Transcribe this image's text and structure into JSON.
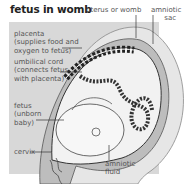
{
  "title": "fetus in womb",
  "labels": {
    "uterus": "uterus or womb",
    "amniotic_sac": "amniotic\n      sac",
    "placenta": "placenta\n(supplies food and\noxygen to fetus)",
    "umbilical_cord": "umbilical cord\n(connects fetus\nwith placenta)",
    "fetus": "fetus\n(unborn\nbaby)",
    "cervix": "cervix",
    "amniotic_fluid": "amniotic\nfluid"
  },
  "colors": {
    "panel": "#d8d8d8",
    "outline": "#444444",
    "text": "#555555"
  }
}
